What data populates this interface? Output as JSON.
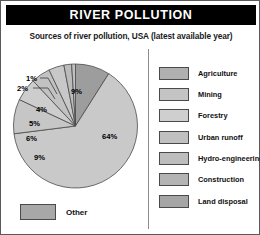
{
  "header": {
    "title": "RIVER POLLUTION"
  },
  "subtitle": "Sources of river pollution, USA (latest available year)",
  "other": {
    "label": "Other",
    "color": "#a8a8a8"
  },
  "legend": {
    "items": [
      {
        "label": "Agriculture",
        "color": "#b0b0b0"
      },
      {
        "label": "Mining",
        "color": "#c4c4c4"
      },
      {
        "label": "Forestry",
        "color": "#cfcfcf"
      },
      {
        "label": "Urban runoff",
        "color": "#c0c0c0"
      },
      {
        "label": "Hydro-engineering",
        "color": "#bdbdbd"
      },
      {
        "label": "Construction",
        "color": "#b4b4b4"
      },
      {
        "label": "Land disposal",
        "color": "#a6a6a6"
      }
    ]
  },
  "chart_data": {
    "type": "pie",
    "title": "Sources of river pollution, USA (latest available year)",
    "legend_position": "right",
    "categories": [
      "Agriculture",
      "Mining",
      "Forestry",
      "Urban runoff",
      "Hydro-engineering",
      "Construction",
      "Land disposal"
    ],
    "values": [
      64,
      9,
      6,
      5,
      4,
      2,
      1
    ],
    "labels": [
      "64%",
      "9%",
      "6%",
      "5%",
      "4%",
      "2%",
      "1%"
    ],
    "colors": [
      "#c9c9c9",
      "#c6c6c6",
      "#cdcdcd",
      "#c2c2c2",
      "#c8c8c8",
      "#bcbcbc",
      "#c0c0c0"
    ],
    "extra_slice": {
      "label": "9%",
      "value": 9,
      "color": "#9d9d9d"
    },
    "units": "percent",
    "total": 100
  }
}
